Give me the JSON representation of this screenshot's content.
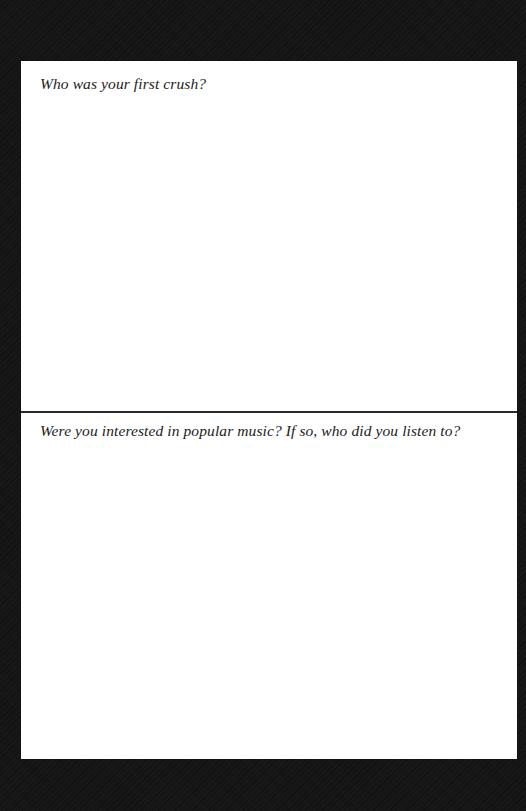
{
  "document": {
    "type": "journal-prompt-page",
    "background_color": "#161616",
    "page_color": "#ffffff",
    "divider_color": "#2a2a2a",
    "sections": [
      {
        "question": "Who was your first crush?",
        "answer": ""
      },
      {
        "question": "Were you interested in popular music? If so, who did you listen to?",
        "answer": ""
      }
    ]
  }
}
